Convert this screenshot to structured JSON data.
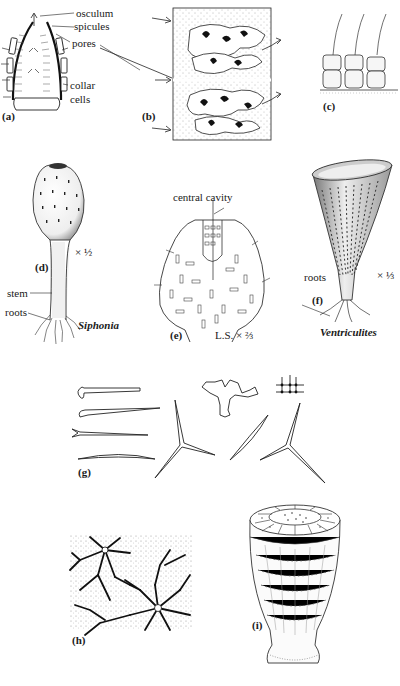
{
  "figure": {
    "panels": {
      "a": {
        "label": "(a)",
        "annotations": [
          "osculum",
          "spicules",
          "pores",
          "collar",
          "cells"
        ]
      },
      "b": {
        "label": "(b)"
      },
      "c": {
        "label": "(c)"
      },
      "d": {
        "label": "(d)",
        "scale": "× ½",
        "annotations": [
          "stem",
          "roots"
        ],
        "taxon": "Siphonia"
      },
      "e": {
        "label": "(e)",
        "annotations": [
          "central cavity"
        ],
        "scale": "L.S. × ⅔"
      },
      "f": {
        "label": "(f)",
        "annotations": [
          "roots"
        ],
        "scale": "× ⅓",
        "taxon": "Ventriculites"
      },
      "g": {
        "label": "(g)"
      },
      "h": {
        "label": "(h)"
      },
      "i": {
        "label": "(i)"
      }
    }
  }
}
